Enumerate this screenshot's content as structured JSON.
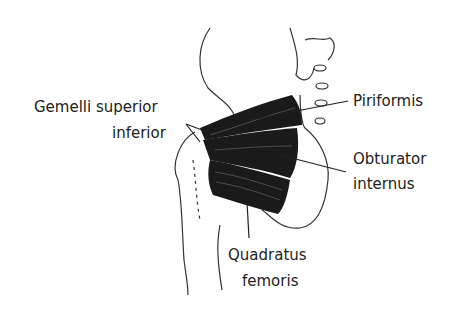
{
  "diagram": {
    "labels": {
      "gemelli_line1": "Gemelli superior",
      "gemelli_line2": "inferior",
      "piriformis": "Piriformis",
      "obturator_line1": "Obturator",
      "obturator_line2": "internus",
      "quadratus_line1": "Quadratus",
      "quadratus_line2": "femoris"
    },
    "colors": {
      "outline": "#333333",
      "muscle": "#1a1a1a",
      "text": "#222222",
      "background": "#ffffff"
    }
  }
}
